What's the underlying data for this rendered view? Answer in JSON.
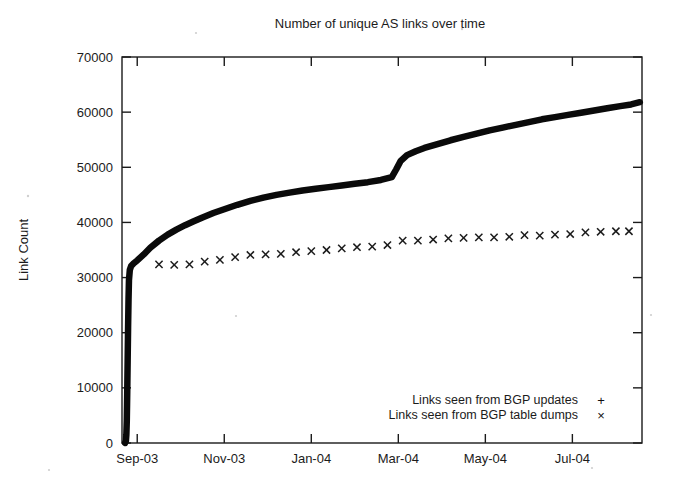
{
  "chart_data": {
    "type": "line",
    "title": "Number of unique AS links over time",
    "xlabel": "",
    "ylabel": "Link Count",
    "ylim": [
      0,
      70000
    ],
    "ytick_labels": [
      "0",
      "10000",
      "20000",
      "30000",
      "40000",
      "50000",
      "60000",
      "70000"
    ],
    "ytick_values": [
      0,
      10000,
      20000,
      30000,
      40000,
      50000,
      60000,
      70000
    ],
    "xtick_labels": [
      "Sep-03",
      "Nov-03",
      "Jan-04",
      "Mar-04",
      "May-04",
      "Jul-04"
    ],
    "xtick_months": [
      0,
      2,
      4,
      6,
      8,
      10
    ],
    "xlim_months": [
      -0.35,
      11.6
    ],
    "grid": false,
    "legend_position": "bottom-right",
    "series": [
      {
        "name": "Links seen from BGP updates",
        "marker": "+",
        "style": "dense-line",
        "points": [
          [
            -0.28,
            0
          ],
          [
            -0.26,
            400
          ],
          [
            -0.25,
            1500
          ],
          [
            -0.24,
            4000
          ],
          [
            -0.23,
            9000
          ],
          [
            -0.22,
            15000
          ],
          [
            -0.21,
            21000
          ],
          [
            -0.2,
            26000
          ],
          [
            -0.19,
            29500
          ],
          [
            -0.17,
            31400
          ],
          [
            -0.14,
            32100
          ],
          [
            -0.08,
            32600
          ],
          [
            0.0,
            33100
          ],
          [
            0.15,
            34200
          ],
          [
            0.3,
            35400
          ],
          [
            0.5,
            36700
          ],
          [
            0.7,
            37800
          ],
          [
            0.9,
            38700
          ],
          [
            1.1,
            39500
          ],
          [
            1.3,
            40200
          ],
          [
            1.5,
            40900
          ],
          [
            1.75,
            41700
          ],
          [
            2.0,
            42400
          ],
          [
            2.3,
            43200
          ],
          [
            2.6,
            43900
          ],
          [
            2.9,
            44500
          ],
          [
            3.2,
            45000
          ],
          [
            3.5,
            45400
          ],
          [
            3.8,
            45800
          ],
          [
            4.1,
            46100
          ],
          [
            4.4,
            46400
          ],
          [
            4.7,
            46700
          ],
          [
            5.0,
            47000
          ],
          [
            5.3,
            47300
          ],
          [
            5.6,
            47700
          ],
          [
            5.85,
            48200
          ],
          [
            5.95,
            49600
          ],
          [
            6.05,
            51100
          ],
          [
            6.2,
            52200
          ],
          [
            6.4,
            52900
          ],
          [
            6.6,
            53500
          ],
          [
            6.9,
            54200
          ],
          [
            7.2,
            54900
          ],
          [
            7.5,
            55500
          ],
          [
            7.8,
            56100
          ],
          [
            8.1,
            56700
          ],
          [
            8.4,
            57200
          ],
          [
            8.7,
            57700
          ],
          [
            9.0,
            58200
          ],
          [
            9.3,
            58700
          ],
          [
            9.6,
            59100
          ],
          [
            9.9,
            59500
          ],
          [
            10.2,
            59900
          ],
          [
            10.5,
            60300
          ],
          [
            10.8,
            60700
          ],
          [
            11.1,
            61100
          ],
          [
            11.35,
            61400
          ],
          [
            11.55,
            61800
          ]
        ]
      },
      {
        "name": "Links seen from BGP table dumps",
        "marker": "x",
        "style": "points",
        "points": [
          [
            0.5,
            32400
          ],
          [
            0.85,
            32300
          ],
          [
            1.2,
            32400
          ],
          [
            1.55,
            32900
          ],
          [
            1.9,
            33200
          ],
          [
            2.25,
            33700
          ],
          [
            2.6,
            34100
          ],
          [
            2.95,
            34200
          ],
          [
            3.3,
            34300
          ],
          [
            3.65,
            34600
          ],
          [
            4.0,
            34800
          ],
          [
            4.35,
            35000
          ],
          [
            4.7,
            35300
          ],
          [
            5.05,
            35500
          ],
          [
            5.4,
            35600
          ],
          [
            5.75,
            35900
          ],
          [
            6.1,
            36700
          ],
          [
            6.45,
            36700
          ],
          [
            6.8,
            36900
          ],
          [
            7.15,
            37100
          ],
          [
            7.5,
            37200
          ],
          [
            7.85,
            37300
          ],
          [
            8.2,
            37300
          ],
          [
            8.55,
            37400
          ],
          [
            8.9,
            37700
          ],
          [
            9.25,
            37600
          ],
          [
            9.6,
            37800
          ],
          [
            9.95,
            37900
          ],
          [
            10.3,
            38200
          ],
          [
            10.65,
            38300
          ],
          [
            11.0,
            38400
          ],
          [
            11.3,
            38400
          ]
        ]
      }
    ]
  },
  "legend": {
    "entries": [
      {
        "label": "Links seen from BGP updates",
        "marker": "+"
      },
      {
        "label": "Links seen from BGP table dumps",
        "marker": "×"
      }
    ]
  }
}
